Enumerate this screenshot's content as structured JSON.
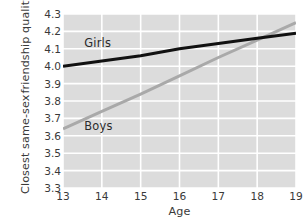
{
  "chart_data": {
    "type": "line",
    "title": "",
    "xlabel": "Age",
    "ylabel_line1": "Closest same-sex",
    "ylabel_line2": "friendship quality",
    "x": [
      13,
      14,
      15,
      16,
      17,
      18,
      19
    ],
    "xtick_labels": [
      "13",
      "14",
      "15",
      "16",
      "17",
      "18",
      "19"
    ],
    "xlim": [
      13,
      19
    ],
    "ytick_labels": [
      "4.3",
      "4.2",
      "4.1",
      "4.0",
      "3.9",
      "3.8",
      "3.7",
      "3.6",
      "3.5",
      "3.4",
      "3.3"
    ],
    "ytick_values": [
      4.3,
      4.2,
      4.1,
      4.0,
      3.9,
      3.8,
      3.7,
      3.6,
      3.5,
      3.4,
      3.3
    ],
    "ylim": [
      3.3,
      4.3
    ],
    "grid": true,
    "grid_color": "#ffffff",
    "panel_color": "#dcdcdc",
    "legend_position": "inline-labels",
    "series": [
      {
        "name": "Girls",
        "color": "#111111",
        "width": 3.0,
        "values": [
          4.0,
          4.03,
          4.06,
          4.1,
          4.13,
          4.16,
          4.19
        ],
        "label_x": 13.55,
        "label_y": 4.135
      },
      {
        "name": "Boys",
        "color": "#a9a9a9",
        "width": 3.0,
        "values": [
          3.64,
          3.74,
          3.84,
          3.945,
          4.05,
          4.15,
          4.25
        ],
        "label_x": 13.55,
        "label_y": 3.655
      }
    ]
  }
}
